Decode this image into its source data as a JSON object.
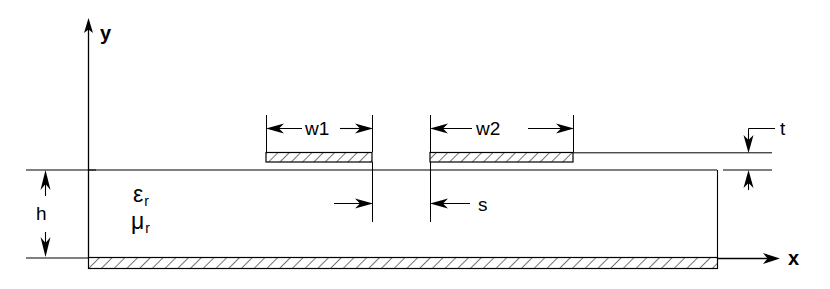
{
  "figure": {
    "kind": "cross-section-diagram",
    "background_color": "#ffffff",
    "line_color": "#000000"
  },
  "axes": {
    "x_label": "x",
    "y_label": "y",
    "origin_label": ""
  },
  "materials": {
    "permittivity_symbol": "ε",
    "permittivity_subscript": "r",
    "permeability_symbol": "μ",
    "permeability_subscript": "r"
  },
  "dimensions": {
    "width_1_label": "w1",
    "width_2_label": "w2",
    "spacing_label": "s",
    "thickness_label": "t",
    "height_label": "h"
  },
  "geometry": {
    "substrate": {
      "x_left": 88,
      "x_right": 717,
      "y_top": 170,
      "y_bottom": 257
    },
    "ground_plane": {
      "x_left": 88,
      "x_right": 717,
      "y_top": 257,
      "y_bottom": 268,
      "hatched": true
    },
    "strip_1": {
      "x_left": 266,
      "x_right": 372,
      "y_top": 153,
      "y_bottom": 162,
      "hatched": true
    },
    "strip_2": {
      "x_left": 430,
      "x_right": 573,
      "y_top": 153,
      "y_bottom": 162,
      "hatched": true
    },
    "y_axis": {
      "x": 88,
      "y_top": 20,
      "y_bottom": 258
    },
    "x_axis": {
      "y": 258,
      "x_left": 88,
      "x_right": 778
    }
  }
}
